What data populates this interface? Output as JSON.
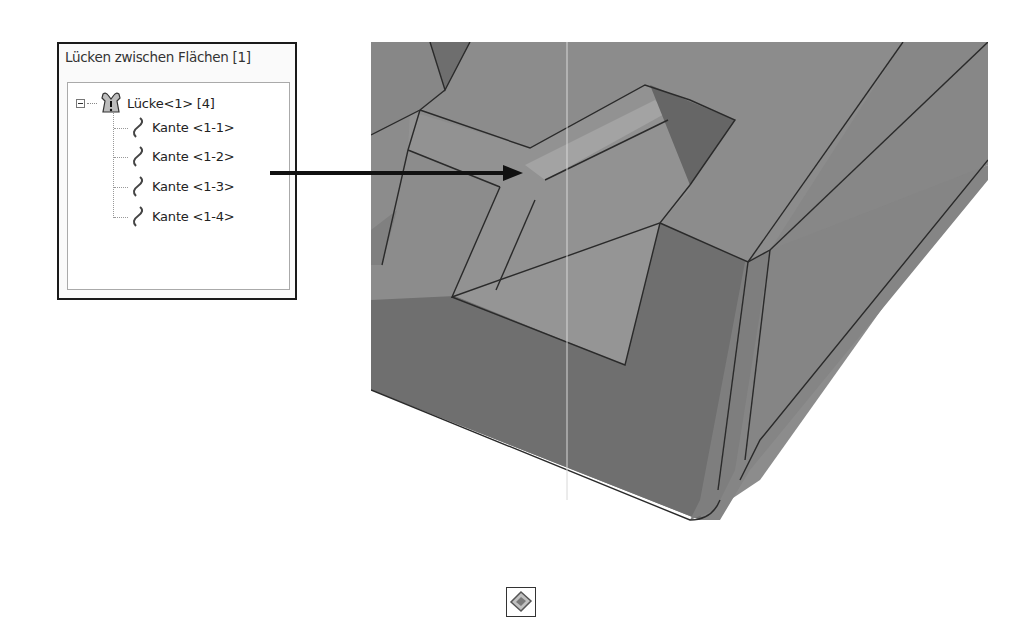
{
  "panel": {
    "title": "Lücken zwischen Flächen [1]",
    "tree": {
      "root": {
        "label": "Lücke<1> [4]",
        "icon": "gap-warning-icon",
        "expanded": true
      },
      "children": [
        {
          "label": "Kante <1-1>",
          "icon": "edge-curve-icon"
        },
        {
          "label": "Kante <1-2>",
          "icon": "edge-curve-icon"
        },
        {
          "label": "Kante <1-3>",
          "icon": "edge-curve-icon"
        },
        {
          "label": "Kante <1-4>",
          "icon": "edge-curve-icon"
        }
      ]
    }
  },
  "callout": {
    "from": "Kante <1-2>",
    "target": "gap-location"
  },
  "viewport": {
    "content": "3D model view (gray shaded part)"
  },
  "bottom_icon": {
    "name": "surface-repair-icon"
  },
  "colors": {
    "face_light": "#8e8e8e",
    "face_mid": "#7d7d7d",
    "face_dark": "#6a6a6a",
    "face_darker": "#5e5e5e",
    "edge": "#2a2a2a"
  }
}
